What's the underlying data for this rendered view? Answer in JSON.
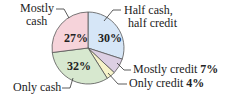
{
  "chart_data": {
    "type": "pie",
    "title": "",
    "start_angle": "12 o'clock, clockwise",
    "slices": [
      {
        "label": "Half cash, half credit",
        "label_lines": [
          "Half cash,",
          "half credit"
        ],
        "value": 30,
        "display": "30%",
        "color": "#d6e6f7"
      },
      {
        "label": "Mostly credit",
        "value": 7,
        "display": "7%",
        "color": "#dccfe3"
      },
      {
        "label": "Only credit",
        "value": 4,
        "display": "4%",
        "color": "#f6f3c9"
      },
      {
        "label": "Only cash",
        "value": 32,
        "display": "32%",
        "color": "#d7e8cf"
      },
      {
        "label": "Mostly cash",
        "label_lines": [
          "Mostly",
          "cash"
        ],
        "value": 27,
        "display": "27%",
        "color": "#f6d3da"
      }
    ],
    "legend": "none (callout labels)"
  },
  "labels": {
    "half_line1": "Half cash,",
    "half_line2": "half credit",
    "mostly_credit": "Mostly credit",
    "mostly_credit_pct": "7%",
    "only_credit": "Only credit",
    "only_credit_pct": "4%",
    "only_cash": "Only cash",
    "mostly_cash_line1": "Mostly",
    "mostly_cash_line2": "cash",
    "pct_half": "30%",
    "pct_only_cash": "32%",
    "pct_mostly_cash": "27%"
  }
}
